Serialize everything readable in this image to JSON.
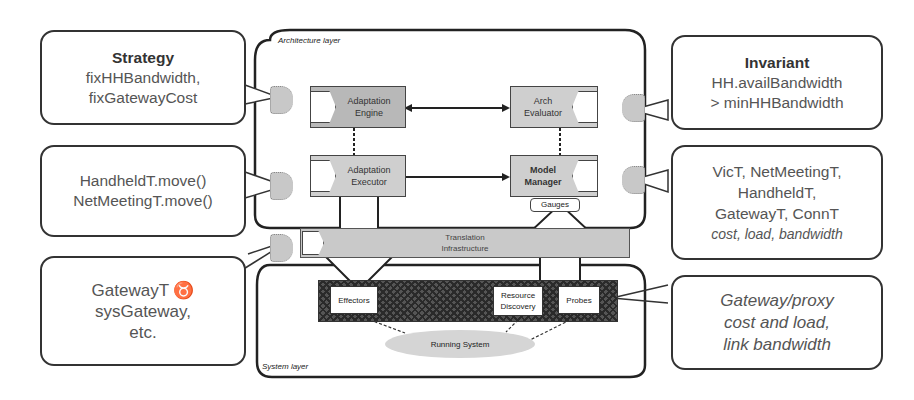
{
  "diagram": {
    "architecture_layer": {
      "label": "Architecture layer",
      "components": {
        "adaptation_engine": {
          "line1": "Adaptation",
          "line2": "Engine"
        },
        "arch_evaluator": {
          "line1": "Arch",
          "line2": "Evaluator"
        },
        "adaptation_executor": {
          "line1": "Adaptation",
          "line2": "Executor"
        },
        "model_manager": {
          "line1": "Model",
          "line2": "Manager"
        },
        "gauges": "Gauges"
      }
    },
    "translation_infrastructure": {
      "line1": "Translation",
      "line2": "Infrastructure"
    },
    "system_layer": {
      "label": "System layer",
      "components": {
        "effectors": "Effectors",
        "resource_discovery": {
          "line1": "Resource",
          "line2": "Discovery"
        },
        "probes": "Probes",
        "running_system": "Running System"
      }
    },
    "callouts": {
      "strategy": {
        "title": "Strategy",
        "line1": "fixHHBandwidth,",
        "line2": "fixGatewayCost"
      },
      "operators": {
        "line1": "HandheldT.move()",
        "line2": "NetMeetingT.move()"
      },
      "mapping": {
        "line1": "GatewayT  ♉",
        "line2": "sysGateway,",
        "line3": "etc."
      },
      "invariant": {
        "title": "Invariant",
        "line1": "HH.availBandwidth",
        "line2": "> minHHBandwidth"
      },
      "types": {
        "line1": "VicT, NetMeetingT,",
        "line2": "HandheldT,",
        "line3": "GatewayT, ConnT",
        "line4": "cost, load, bandwidth"
      },
      "monitored": {
        "line1": "Gateway/proxy",
        "line2": "cost and load,",
        "line3": "link bandwidth"
      }
    }
  }
}
